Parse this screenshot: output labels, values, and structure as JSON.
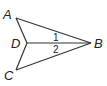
{
  "diagram": {
    "type": "geometry",
    "points": {
      "A": {
        "label": "A",
        "x": 16,
        "y": 18,
        "lx": 3,
        "ly": 19
      },
      "B": {
        "label": "B",
        "x": 91,
        "y": 43,
        "lx": 94,
        "ly": 48
      },
      "C": {
        "label": "C",
        "x": 16,
        "y": 70,
        "lx": 4,
        "ly": 80
      },
      "D": {
        "label": "D",
        "x": 27,
        "y": 43,
        "lx": 11,
        "ly": 48
      }
    },
    "segments": [
      [
        "A",
        "B"
      ],
      [
        "A",
        "D"
      ],
      [
        "D",
        "B"
      ],
      [
        "D",
        "C"
      ],
      [
        "C",
        "B"
      ]
    ],
    "angle_labels": [
      {
        "label": "1",
        "x": 56,
        "y": 41
      },
      {
        "label": "2",
        "x": 56,
        "y": 53
      }
    ],
    "colors": {
      "stroke": "#333333",
      "text": "#222222",
      "background": "#ffffff"
    }
  }
}
